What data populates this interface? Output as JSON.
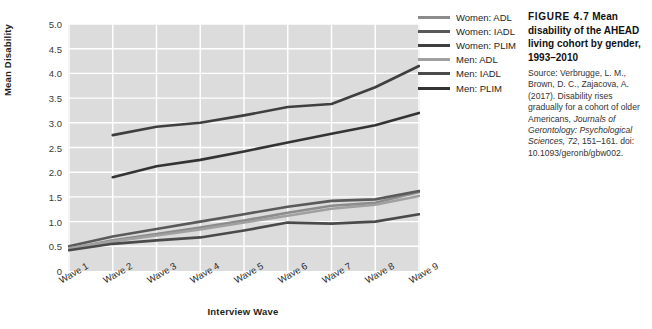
{
  "chart_data": {
    "type": "line",
    "title": "",
    "xlabel": "Interview Wave",
    "ylabel": "Mean Disability",
    "categories": [
      "Wave 1",
      "Wave 2",
      "Wave 3",
      "Wave 4",
      "Wave 5",
      "Wave 6",
      "Wave 7",
      "Wave 8",
      "Wave 9"
    ],
    "ylim": [
      0,
      5
    ],
    "ytick_labels": [
      "0",
      "0.5",
      "1.0",
      "1.5",
      "2.0",
      "2.5",
      "3.0",
      "3.5",
      "4.0",
      "4.5",
      "5.0"
    ],
    "ytick_values": [
      0,
      0.5,
      1.0,
      1.5,
      2.0,
      2.5,
      3.0,
      3.5,
      4.0,
      4.5,
      5.0
    ],
    "grid": true,
    "legend_position": "right",
    "series": [
      {
        "name": "Women: ADL",
        "color": "#8c8c8c",
        "values": [
          0.45,
          0.62,
          0.75,
          0.88,
          1.02,
          1.18,
          1.32,
          1.38,
          1.6
        ]
      },
      {
        "name": "Women: IADL",
        "color": "#5a5a5a",
        "values": [
          0.5,
          0.7,
          0.85,
          1.0,
          1.15,
          1.3,
          1.42,
          1.45,
          1.62
        ]
      },
      {
        "name": "Women: PLIM",
        "color": "#3f3f3f",
        "values": [
          null,
          2.75,
          2.92,
          3.0,
          3.15,
          3.32,
          3.38,
          3.72,
          4.15
        ]
      },
      {
        "name": "Men: ADL",
        "color": "#a0a0a0",
        "values": [
          0.46,
          0.6,
          0.72,
          0.84,
          0.98,
          1.12,
          1.26,
          1.34,
          1.52
        ]
      },
      {
        "name": "Men: IADL",
        "color": "#4a4a4a",
        "values": [
          0.42,
          0.55,
          0.62,
          0.68,
          0.82,
          0.98,
          0.96,
          1.0,
          1.15
        ]
      },
      {
        "name": "Men: PLIM",
        "color": "#333333",
        "values": [
          null,
          1.9,
          2.12,
          2.25,
          2.42,
          2.6,
          2.78,
          2.95,
          3.2
        ]
      }
    ]
  },
  "legend": {
    "entries": [
      {
        "label": "Women: ADL",
        "color": "#8c8c8c"
      },
      {
        "label": "Women: IADL",
        "color": "#5a5a5a"
      },
      {
        "label": "Women: PLIM",
        "color": "#3f3f3f"
      },
      {
        "label": "Men: ADL",
        "color": "#a0a0a0"
      },
      {
        "label": "Men: IADL",
        "color": "#4a4a4a"
      },
      {
        "label": "Men: PLIM",
        "color": "#333333"
      }
    ]
  },
  "caption": {
    "figure_number": "FIGURE 4.7",
    "title": "Mean disability of the AHEAD living cohort by gender, 1993–2010",
    "source_prefix": "Source: Verbrugge, L. M., Brown, D. C., Zajacova, A. (2017). Disability rises gradually for a cohort of older Americans, ",
    "source_italic_1": "Journals of Gerontology: Psychological Sciences, 72",
    "source_middle": ", 151–161. doi: 10.1093/geronb/gbw002."
  },
  "style": {
    "plot_background": "#dcdcdc",
    "gridline_color": "#ffffff",
    "page_background": "#ffffff"
  }
}
